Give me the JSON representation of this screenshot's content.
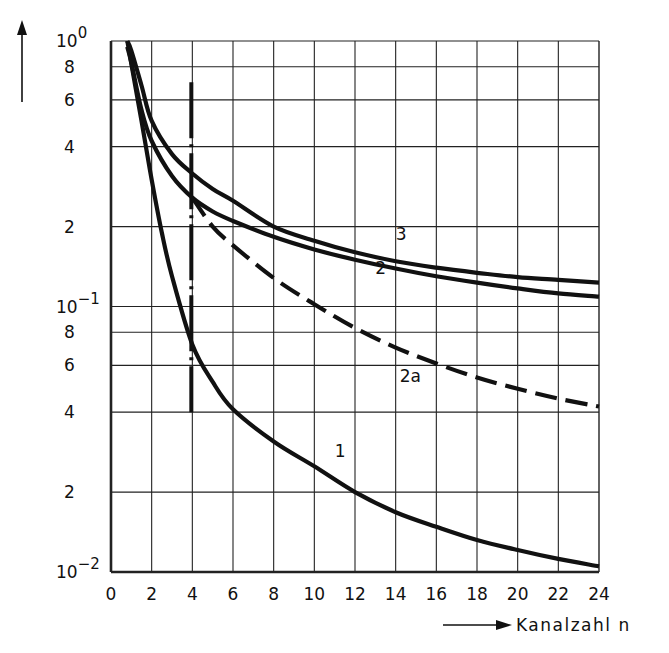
{
  "chart_data": {
    "type": "line",
    "title": "",
    "xlabel": "Kanalzahl n",
    "ylabel": "",
    "x_scale": "linear",
    "y_scale": "log",
    "xlim": [
      0,
      24
    ],
    "ylim": [
      0.01,
      1
    ],
    "grid": true,
    "x_ticks": [
      0,
      2,
      4,
      6,
      8,
      10,
      12,
      14,
      16,
      18,
      20,
      22,
      24
    ],
    "y_ticks": [
      {
        "value": 1,
        "label": "10^0",
        "base": "10",
        "exp": "0"
      },
      {
        "value": 0.8,
        "label": "8"
      },
      {
        "value": 0.6,
        "label": "6"
      },
      {
        "value": 0.4,
        "label": "4"
      },
      {
        "value": 0.2,
        "label": "2"
      },
      {
        "value": 0.1,
        "label": "10^-1",
        "base": "10",
        "exp": "−1"
      },
      {
        "value": 0.08,
        "label": "8"
      },
      {
        "value": 0.06,
        "label": "6"
      },
      {
        "value": 0.04,
        "label": "4"
      },
      {
        "value": 0.02,
        "label": "2"
      },
      {
        "value": 0.01,
        "label": "10^-2",
        "base": "10",
        "exp": "−2"
      }
    ],
    "series": [
      {
        "name": "1",
        "style": "solid",
        "x": [
          0.8,
          1.5,
          2,
          2.5,
          3,
          4,
          5,
          6,
          8,
          10,
          12,
          14,
          16,
          18,
          20,
          22,
          24
        ],
        "y": [
          1.0,
          0.5,
          0.3,
          0.19,
          0.13,
          0.072,
          0.052,
          0.041,
          0.031,
          0.025,
          0.02,
          0.0168,
          0.0148,
          0.0132,
          0.0121,
          0.0112,
          0.0105
        ],
        "label_pos": {
          "x": 11.0,
          "y": 0.027
        }
      },
      {
        "name": "2",
        "style": "solid",
        "x": [
          0.8,
          1,
          1.5,
          2,
          3,
          4,
          5,
          6,
          8,
          10,
          12,
          14,
          16,
          18,
          20,
          22,
          24
        ],
        "y": [
          0.95,
          0.83,
          0.55,
          0.42,
          0.31,
          0.257,
          0.228,
          0.21,
          0.183,
          0.164,
          0.15,
          0.139,
          0.13,
          0.123,
          0.117,
          0.112,
          0.109
        ],
        "label_pos": {
          "x": 13.0,
          "y": 0.132
        }
      },
      {
        "name": "2a",
        "style": "dashed",
        "x": [
          4,
          5,
          6,
          8,
          10,
          12,
          14,
          16,
          18,
          20,
          22,
          24
        ],
        "y": [
          0.257,
          0.2,
          0.17,
          0.128,
          0.102,
          0.083,
          0.07,
          0.061,
          0.054,
          0.049,
          0.045,
          0.042
        ],
        "label_pos": {
          "x": 14.2,
          "y": 0.052
        }
      },
      {
        "name": "3",
        "style": "solid",
        "x": [
          0.8,
          1,
          1.5,
          2,
          3,
          4,
          5,
          6,
          8,
          10,
          12,
          14,
          16,
          18,
          20,
          22,
          24
        ],
        "y": [
          1.0,
          0.92,
          0.68,
          0.5,
          0.375,
          0.317,
          0.277,
          0.25,
          0.2,
          0.177,
          0.16,
          0.148,
          0.14,
          0.134,
          0.129,
          0.126,
          0.123
        ],
        "label_pos": {
          "x": 14.0,
          "y": 0.178
        }
      }
    ],
    "annotations": [
      {
        "type": "vertical-dash-dot-line",
        "x": 4,
        "y_from": 0.04,
        "y_to": 0.7
      }
    ],
    "y_axis_arrow": true,
    "x_axis_arrow": true
  }
}
